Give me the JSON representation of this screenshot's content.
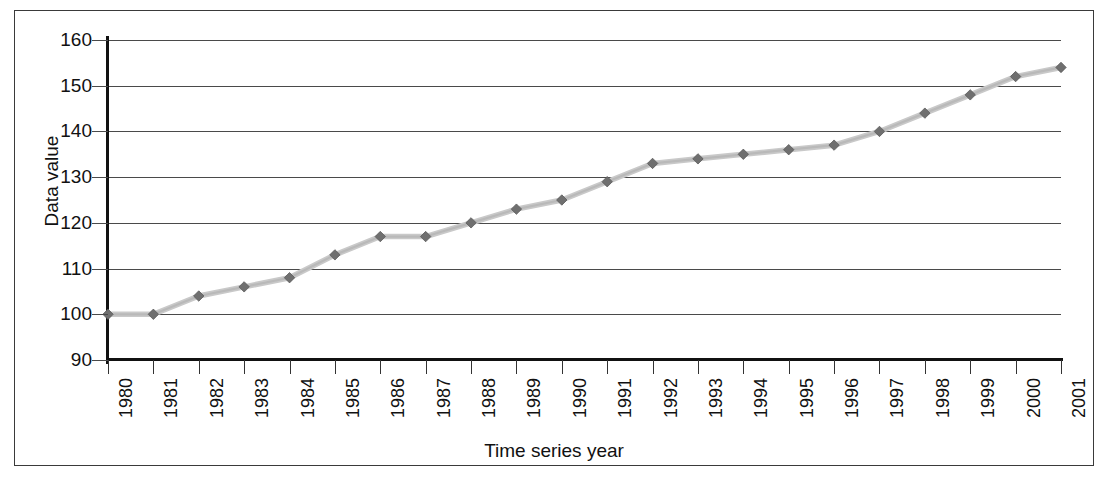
{
  "chart_data": {
    "type": "line",
    "title": "",
    "xlabel": "Time series year",
    "ylabel": "Data value",
    "xlim": [
      1980,
      2001
    ],
    "ylim": [
      90,
      160
    ],
    "ytick_step": 10,
    "grid": true,
    "legend": "none",
    "marker": "diamond",
    "line_color": "#c9c9c9",
    "marker_color": "#6f6f6f",
    "categories": [
      "1980",
      "1981",
      "1982",
      "1983",
      "1984",
      "1985",
      "1986",
      "1987",
      "1988",
      "1989",
      "1990",
      "1991",
      "1992",
      "1993",
      "1994",
      "1995",
      "1996",
      "1997",
      "1998",
      "1999",
      "2000",
      "2001"
    ],
    "values": [
      100,
      100,
      104,
      106,
      108,
      113,
      117,
      117,
      120,
      123,
      125,
      129,
      133,
      134,
      135,
      136,
      137,
      140,
      144,
      148,
      152,
      154
    ],
    "ytick_labels": [
      "160",
      "150",
      "140",
      "130",
      "120",
      "110",
      "100",
      "90"
    ],
    "ytick_values": [
      160,
      150,
      140,
      130,
      120,
      110,
      100,
      90
    ]
  },
  "axes": {
    "x_title": "Time series year",
    "y_title": "Data value"
  }
}
